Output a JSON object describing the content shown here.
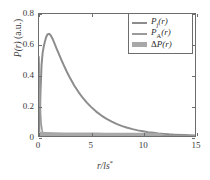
{
  "chart_data": {
    "type": "line",
    "title": "",
    "xlabel": "r/ls*",
    "ylabel": "P(r) (a.u.)",
    "xlim": [
      0,
      15
    ],
    "ylim": [
      0,
      0.8
    ],
    "grid": false,
    "legend_position": "top-right",
    "xticks": [
      0,
      5,
      10,
      15
    ],
    "xticklabels": [
      "0",
      "5",
      "10",
      "15"
    ],
    "yticks": [
      0,
      0.2,
      0.4,
      0.6,
      0.8
    ],
    "yticklabels": [
      "0",
      "0.2",
      "0.4",
      "0.6",
      "0.8"
    ],
    "series": [
      {
        "name": "P_j(r)",
        "label_main": "P",
        "label_sub": "j",
        "label_arg": "(r)",
        "color": "#8c8c8c",
        "width": 2.0,
        "style": "line",
        "x": [
          0.0,
          0.08,
          0.15,
          0.25,
          0.35,
          0.45,
          0.55,
          0.65,
          0.75,
          0.85,
          0.95,
          1.05,
          1.15,
          1.3,
          1.5,
          1.7,
          1.9,
          2.1,
          2.4,
          2.7,
          3.0,
          3.4,
          3.8,
          4.2,
          4.6,
          5.0,
          5.5,
          6.0,
          6.5,
          7.0,
          7.5,
          8.0,
          8.5,
          9.0,
          9.5,
          10.0,
          10.5,
          11.0,
          11.5,
          12.0,
          12.5,
          13.0,
          14.0,
          15.0
        ],
        "y": [
          0.0,
          0.12,
          0.3,
          0.47,
          0.545,
          0.585,
          0.615,
          0.64,
          0.658,
          0.668,
          0.67,
          0.666,
          0.657,
          0.638,
          0.605,
          0.572,
          0.54,
          0.508,
          0.462,
          0.418,
          0.378,
          0.33,
          0.288,
          0.251,
          0.219,
          0.191,
          0.16,
          0.134,
          0.112,
          0.094,
          0.078,
          0.065,
          0.054,
          0.045,
          0.037,
          0.031,
          0.025,
          0.021,
          0.017,
          0.014,
          0.011,
          0.009,
          0.006,
          0.004
        ]
      },
      {
        "name": "P_A(r)",
        "label_main": "P",
        "label_sub": "A",
        "label_arg": "(r)",
        "color": "#9a9a9a",
        "width": 1.6,
        "style": "line",
        "x": [
          0.0,
          0.05,
          0.1,
          0.15,
          0.2,
          0.3,
          0.4,
          0.5,
          0.7,
          1.0,
          1.5,
          2.0,
          3.0,
          4.0,
          5.0,
          7.0,
          9.0,
          11.0,
          13.0,
          15.0
        ],
        "y": [
          0.52,
          0.4,
          0.26,
          0.15,
          0.085,
          0.035,
          0.018,
          0.012,
          0.008,
          0.006,
          0.005,
          0.004,
          0.003,
          0.003,
          0.002,
          0.002,
          0.002,
          0.001,
          0.001,
          0.001
        ]
      },
      {
        "name": "AP(r)",
        "label_main": "A",
        "label_sub": "",
        "label_arg": "P(r)",
        "color": "#a8a8a8",
        "width": 4.5,
        "style": "thick-line",
        "x": [
          0.0,
          0.1,
          0.2,
          0.4,
          0.8,
          1.5,
          2.5,
          3.5,
          4.5,
          5.5,
          6.5,
          7.5,
          8.5,
          9.5,
          10.5,
          11.2,
          11.5
        ],
        "y": [
          0.012,
          0.013,
          0.013,
          0.012,
          0.011,
          0.01,
          0.009,
          0.009,
          0.008,
          0.008,
          0.007,
          0.007,
          0.006,
          0.006,
          0.006,
          0.005,
          0.005
        ]
      }
    ]
  },
  "legend": {
    "entries": [
      {
        "label_main": "P",
        "label_sub": "j",
        "label_arg": "(r)",
        "swatch": "line"
      },
      {
        "label_main": "P",
        "label_sub": "A",
        "label_arg": "(r)",
        "swatch": "line"
      },
      {
        "label_main": "Δ",
        "label_sub": "",
        "label_arg": "P(r)",
        "swatch": "band"
      }
    ]
  },
  "axes": {
    "xlabel_text": "r/ls",
    "xlabel_sup": "*",
    "ylabel_p": "P(r)",
    "ylabel_units": " (a.u.)"
  }
}
